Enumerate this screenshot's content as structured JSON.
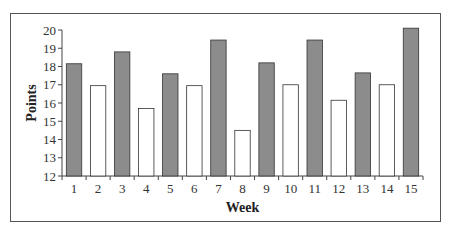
{
  "chart_data": {
    "type": "bar",
    "title": "",
    "xlabel": "Week",
    "ylabel": "Points",
    "ylim": [
      12,
      20
    ],
    "yticks": [
      12,
      13,
      14,
      15,
      16,
      17,
      18,
      19,
      20
    ],
    "grid": false,
    "legend": null,
    "categories": [
      "1",
      "2",
      "3",
      "4",
      "5",
      "6",
      "7",
      "8",
      "9",
      "10",
      "11",
      "12",
      "13",
      "14",
      "15"
    ],
    "values": [
      18.15,
      16.95,
      18.8,
      15.7,
      17.6,
      16.95,
      19.45,
      14.5,
      18.2,
      17.0,
      19.45,
      16.15,
      17.65,
      17.0,
      20.1
    ],
    "bar_fill": [
      "dark",
      "light",
      "dark",
      "light",
      "dark",
      "light",
      "dark",
      "light",
      "dark",
      "light",
      "dark",
      "light",
      "dark",
      "light",
      "dark"
    ],
    "colors": {
      "dark": "#8c8c8c",
      "light": "#ffffff",
      "stroke": "#333333"
    }
  }
}
